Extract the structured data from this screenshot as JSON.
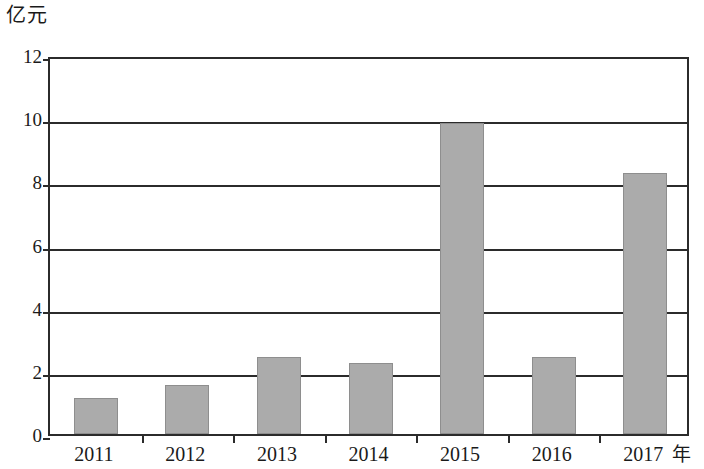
{
  "chart_data": {
    "type": "bar",
    "title": "",
    "subtitle": "",
    "xlabel": "年",
    "ylabel": "亿元",
    "categories": [
      "2011",
      "2012",
      "2013",
      "2014",
      "2015",
      "2016",
      "2017"
    ],
    "values": [
      1.15,
      1.55,
      2.45,
      2.25,
      9.85,
      2.45,
      8.25
    ],
    "series": [
      {
        "name": "",
        "values": [
          1.15,
          1.55,
          2.45,
          2.25,
          9.85,
          2.45,
          8.25
        ]
      }
    ],
    "ylim": [
      0,
      12
    ],
    "y_ticks": [
      "0",
      "2",
      "4",
      "6",
      "8",
      "10",
      "12"
    ],
    "y_tick_values": [
      0,
      2,
      4,
      6,
      8,
      10,
      12
    ],
    "grid": "horizontal",
    "legend": "none",
    "bar_color": "#ababab",
    "axis_color": "#2b2b2b",
    "annotations": []
  },
  "axes": {
    "y_unit_caption": "亿元",
    "x_unit_caption": "年"
  }
}
